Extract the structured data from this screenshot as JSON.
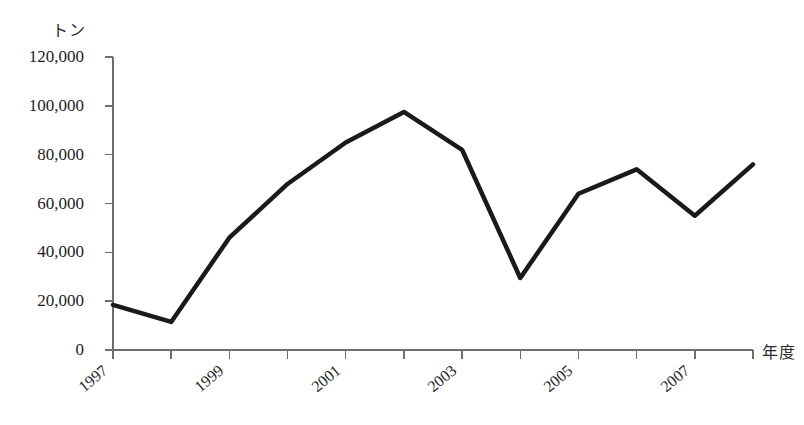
{
  "chart_data": {
    "type": "line",
    "title": "",
    "subtitle": "",
    "xlabel": "年度",
    "ylabel": "トン",
    "x": [
      1997,
      1998,
      1999,
      2000,
      2001,
      2002,
      2003,
      2004,
      2005,
      2006,
      2007,
      2008
    ],
    "categories": [
      "1997",
      "1998",
      "1999",
      "2000",
      "2001",
      "2002",
      "2003",
      "2004",
      "2005",
      "2006",
      "2007",
      "2008"
    ],
    "values": [
      18500,
      11500,
      46000,
      68000,
      85000,
      97500,
      82000,
      29500,
      64000,
      74000,
      55000,
      76000
    ],
    "series": [
      {
        "name": "",
        "values": [
          18500,
          11500,
          46000,
          68000,
          85000,
          97500,
          82000,
          29500,
          64000,
          74000,
          55000,
          76000
        ]
      }
    ],
    "ylim": [
      0,
      120000
    ],
    "xlim": [
      1997,
      2008
    ],
    "yticks": [
      0,
      20000,
      40000,
      60000,
      80000,
      100000,
      120000
    ],
    "ytick_labels": [
      "0",
      "20,000",
      "40,000",
      "60,000",
      "80,000",
      "100,000",
      "120,000"
    ],
    "xticks": [
      1997,
      1998,
      1999,
      2000,
      2001,
      2002,
      2003,
      2004,
      2005,
      2006,
      2007,
      2008
    ],
    "xtick_labels_shown": [
      "1997",
      "",
      "1999",
      "",
      "2001",
      "",
      "2003",
      "",
      "2005",
      "",
      "2007",
      ""
    ],
    "xtick_label_rotation": -40,
    "grid": false,
    "legend": false,
    "legend_position": "none",
    "line_color": "#1a1a1a",
    "line_width": 4.5,
    "axis_color": "#6e6e6e",
    "background_color": "#ffffff",
    "markers": false
  },
  "axis": {
    "y_unit_label": "トン",
    "x_unit_label": "年度"
  },
  "caption": {
    "bottom_text": ""
  }
}
